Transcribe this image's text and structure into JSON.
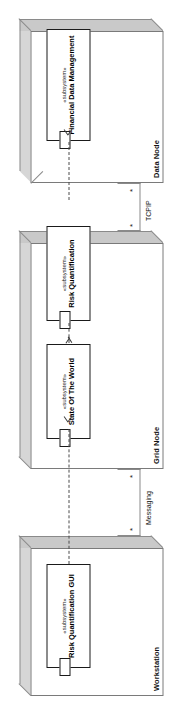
{
  "diagram": {
    "type": "uml-deployment-diagram",
    "orientation": "rotated-90-ccw",
    "colors": {
      "node_fill": "#ffffff",
      "node_border": "#7a7a7a",
      "node_top_face": "#d6d6d6",
      "node_side_face": "#c4c4c4",
      "component_border": "#1a1a1a",
      "path_line": "#8a8a8a",
      "dependency_line": "#4a4a4a",
      "text": "#111111"
    }
  },
  "nodes": [
    {
      "id": "data-node",
      "name": "Data Node",
      "components": [
        {
          "stereotype": "«subsystem»",
          "name": "Financial Data Management"
        }
      ]
    },
    {
      "id": "grid-node",
      "name": "Grid Node",
      "components": [
        {
          "stereotype": "«subsystem»",
          "name": "State Of The World"
        },
        {
          "stereotype": "«subsystem»",
          "name": "Risk Quantification"
        }
      ]
    },
    {
      "id": "workstation",
      "name": "Workstation",
      "components": [
        {
          "stereotype": "«subsystem»",
          "name": "Risk Quantification GUI"
        }
      ]
    }
  ],
  "communication_paths": [
    {
      "id": "tcpip",
      "label": "TCPIP",
      "from": "grid-node",
      "to": "data-node",
      "source_multiplicity": "*",
      "target_multiplicity": "*"
    },
    {
      "id": "messaging",
      "label": "Messaging",
      "from": "workstation",
      "to": "grid-node",
      "source_multiplicity": "*",
      "target_multiplicity": "*"
    }
  ],
  "dependencies": [
    {
      "id": "dep-grid-to-data",
      "from": "State Of The World",
      "to": "Financial Data Management"
    },
    {
      "id": "dep-risk-to-sotw",
      "from": "Risk Quantification",
      "to": "State Of The World"
    },
    {
      "id": "dep-gui-to-risk",
      "from": "Risk Quantification GUI",
      "to": "Risk Quantification"
    }
  ]
}
